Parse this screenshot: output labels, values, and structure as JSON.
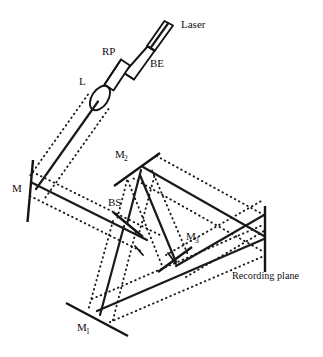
{
  "figure": {
    "domain": "diagram",
    "background_color": "#ffffff",
    "line_color": "#1a1a1a",
    "width": 323,
    "height": 357
  },
  "labels": {
    "laser": "Laser",
    "beam_expander": "BE",
    "rotating_plate": "RP",
    "lens": "L",
    "mirror_m": "M",
    "mirror_m1_base": "M",
    "mirror_m1_sub": "1",
    "mirror_m2_base": "M",
    "mirror_m2_sub": "2",
    "mirror_m3_base": "M",
    "mirror_m3_sub": "3",
    "beam_splitter": "BS",
    "recording_plane": "Recording plane"
  },
  "components": [
    {
      "id": "laser",
      "name": "Laser",
      "label": "Laser",
      "kind": "source"
    },
    {
      "id": "be",
      "name": "Beam Expander",
      "label": "BE",
      "kind": "beam-expander"
    },
    {
      "id": "rp",
      "name": "Rotating Plate",
      "label": "RP",
      "kind": "plate"
    },
    {
      "id": "l",
      "name": "Lens",
      "label": "L",
      "kind": "lens"
    },
    {
      "id": "m",
      "name": "Mirror M",
      "label": "M",
      "kind": "mirror"
    },
    {
      "id": "m1",
      "name": "Mirror M1",
      "label": "M1",
      "kind": "mirror"
    },
    {
      "id": "m2",
      "name": "Mirror M2",
      "label": "M2",
      "kind": "mirror"
    },
    {
      "id": "m3",
      "name": "Mirror M3",
      "label": "M3",
      "kind": "mirror"
    },
    {
      "id": "bs",
      "name": "Beam Splitter",
      "label": "BS",
      "kind": "beam-splitter"
    },
    {
      "id": "rec",
      "name": "Recording plane",
      "label": "Recording plane",
      "kind": "screen"
    }
  ],
  "beam_paths": [
    {
      "from": "laser",
      "to": "be"
    },
    {
      "from": "be",
      "to": "rp"
    },
    {
      "from": "rp",
      "to": "l"
    },
    {
      "from": "l",
      "to": "m"
    },
    {
      "from": "m",
      "to": "bs"
    },
    {
      "from": "bs",
      "to": "m2"
    },
    {
      "from": "bs",
      "to": "m1"
    },
    {
      "from": "m2",
      "to": "rec"
    },
    {
      "from": "m2",
      "to": "m3"
    },
    {
      "from": "m3",
      "to": "rec"
    },
    {
      "from": "m1",
      "to": "rec"
    }
  ]
}
